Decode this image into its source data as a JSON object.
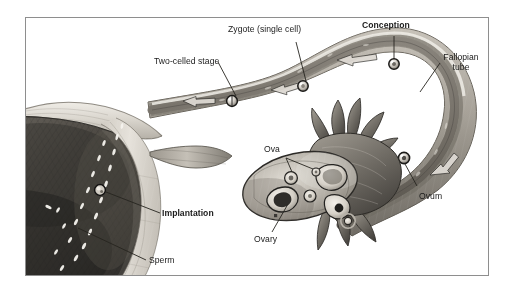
{
  "figure": {
    "type": "anatomical-illustration",
    "style": "grayscale pencil/airbrush medical illustration",
    "frame": {
      "border_color": "#8e8e8e",
      "background": "#ffffff"
    },
    "page_background": "#ffffff"
  },
  "labels": [
    {
      "id": "two-celled-stage",
      "text": "Two-celled stage",
      "bold": false
    },
    {
      "id": "zygote",
      "text": "Zygote (single cell)",
      "bold": false
    },
    {
      "id": "conception",
      "text": "Conception",
      "bold": true
    },
    {
      "id": "fallopian-tube-line1",
      "text": "Fallopian",
      "bold": false
    },
    {
      "id": "fallopian-tube-line2",
      "text": "tube",
      "bold": false
    },
    {
      "id": "ova",
      "text": "Ova",
      "bold": false
    },
    {
      "id": "ovum",
      "text": "Ovum",
      "bold": false
    },
    {
      "id": "ovary",
      "text": "Ovary",
      "bold": false
    },
    {
      "id": "implantation",
      "text": "Implantation",
      "bold": true
    },
    {
      "id": "sperm",
      "text": "Sperm",
      "bold": false
    }
  ],
  "structures": {
    "uterus": "uterus",
    "endometrium": "endometrial lining",
    "fallopian_tube": "fallopian tube",
    "ovary": "ovary",
    "fimbriae": "fimbriae",
    "sperm_cells": "sperm",
    "ovum_cell": "ovum",
    "zygote_cell": "zygote",
    "two_cell_embryo": "two-celled embryo",
    "blastocyst": "implanting blastocyst"
  },
  "colors": {
    "ink": "#1b1b1b",
    "leader_line": "#2a2a2a",
    "frame": "#8e8e8e",
    "tissue_light": "#d8d4cd",
    "tissue_mid": "#9a958d",
    "tissue_dark": "#4a4742",
    "tissue_darkest": "#2b2926",
    "lumen": "#6f6b64",
    "highlight": "#f2efe9"
  }
}
